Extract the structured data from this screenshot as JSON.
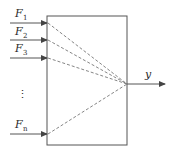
{
  "diagram": {
    "type": "multi-input single-output block",
    "colors": {
      "stroke": "#555555",
      "text": "#2a2a2a",
      "background": "#ffffff"
    },
    "inputs": [
      {
        "label": "F",
        "subscript": "1"
      },
      {
        "label": "F",
        "subscript": "2"
      },
      {
        "label": "F",
        "subscript": "3"
      },
      {
        "label": "F",
        "subscript": "n"
      }
    ],
    "ellipsis": "⋮",
    "output": {
      "label": "y"
    }
  }
}
